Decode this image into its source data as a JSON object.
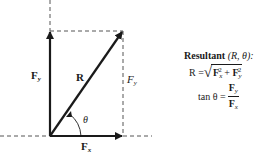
{
  "diagram": {
    "vectors": {
      "fy_label": "F",
      "fy_sub": "y",
      "r_label": "R",
      "fy_dashed_label": "F",
      "fy_dashed_sub": "y",
      "fx_label": "F",
      "fx_sub": "x",
      "angle_label": "θ"
    },
    "colors": {
      "stroke": "#1a1a1a",
      "dashed": "#555555",
      "background": "#ffffff"
    }
  },
  "formula": {
    "title_bold": "Resultant",
    "title_rest": " (R, θ):",
    "resultant_lhs": "R = ",
    "radical": "√",
    "fx_sq": "F",
    "fx_sq_sub": "x",
    "sq": "2",
    "plus": " + ",
    "fy_sq": "F",
    "fy_sq_sub": "y",
    "tan_lhs": "tan θ = ",
    "tan_num": "F",
    "tan_num_sub": "y",
    "tan_den": "F",
    "tan_den_sub": "x"
  }
}
